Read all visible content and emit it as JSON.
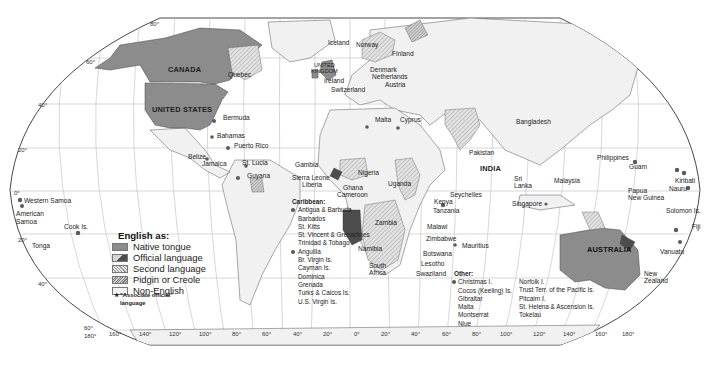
{
  "map": {
    "title": "English as:",
    "legend": [
      {
        "key": "native",
        "label": "Native tongue",
        "color": "#8c8c8c"
      },
      {
        "key": "official",
        "label": "Official language",
        "color": "#4d4d4d"
      },
      {
        "key": "second",
        "label": "Second language",
        "color": "#c8c8c8"
      },
      {
        "key": "pidgin",
        "label": "Pidgin or Creole",
        "color": "#b0b0b0"
      },
      {
        "key": "none",
        "label": "Non-English",
        "color": "#f1f1f1"
      }
    ],
    "note": {
      "symbol": "★",
      "line1": "\"Associate official\"",
      "line2": "language"
    },
    "latitudes": [
      "80°",
      "60°",
      "40°",
      "20°",
      "0°",
      "20°",
      "40°",
      "60°"
    ],
    "longitudes": [
      "180°",
      "160°",
      "140°",
      "120°",
      "100°",
      "80°",
      "60°",
      "40°",
      "20°",
      "0°",
      "20°",
      "40°",
      "60°",
      "80°",
      "100°",
      "120°",
      "140°",
      "160°",
      "180°"
    ],
    "country_labels": {
      "canada": "CANADA",
      "quebec": "Quebec",
      "united_states": "UNITED STATES",
      "iceland": "Iceland",
      "norway": "Norway",
      "finland": "Finland",
      "uk_line1": "UNITED",
      "uk_line2": "KINGDOM",
      "ireland": "Ireland",
      "denmark": "Denmark",
      "netherlands": "Netherlands",
      "austria": "Austria",
      "switzerland": "Switzerland",
      "malta": "Malta",
      "cyprus": "Cyprus",
      "bangladesh": "Bangladesh",
      "pakistan": "Pakistan",
      "india": "INDIA",
      "sri_lanka_1": "Sri",
      "sri_lanka_2": "Lanka",
      "bermuda": "Bermuda",
      "bahamas": "Bahamas",
      "puerto_rico": "Puerto Rico",
      "belize": "Belize",
      "jamaica": "Jamaica",
      "st_lucia": "St. Lucia",
      "guyana": "Guyana",
      "gambia": "Gambia",
      "sierra_leone": "Sierra Leone",
      "liberia": "Liberia",
      "ghana": "Ghana",
      "nigeria": "Nigeria",
      "cameroon": "Cameroon",
      "uganda": "Uganda",
      "kenya": "Kenya",
      "tanzania": "Tanzania",
      "seychelles": "Seychelles",
      "zambia": "Zambia",
      "malawi": "Malawi",
      "zimbabwe": "Zimbabwe",
      "mauritius": "Mauritius",
      "namibia": "Namibia",
      "botswana": "Botswana",
      "south_africa_1": "South",
      "south_africa_2": "Africa",
      "lesotho": "Lesotho",
      "swaziland": "Swaziland",
      "philippines": "Philippines",
      "guam": "Guam",
      "malaysia": "Malaysia",
      "singapore": "Singapore",
      "papua_1": "Papua",
      "papua_2": "New Guinea",
      "kiribati": "Kiribati",
      "nauru": "Nauru",
      "solomon": "Solomon Is.",
      "fiji": "Fiji",
      "vanuatu": "Vanuatu",
      "australia": "AUSTRALIA",
      "new_zealand_1": "New",
      "new_zealand_2": "Zealand",
      "western_samoa": "Western Samoa",
      "american_samoa_1": "American",
      "american_samoa_2": "Samoa",
      "cook": "Cook Is.",
      "tonga": "Tonga"
    },
    "caribbean": {
      "heading": "Caribbean:",
      "group1": [
        "Antigua & Barbuda",
        "Barbados",
        "St. Kitts",
        "St. Vincent & Grenadines",
        "Trinidad & Tobago"
      ],
      "group2": [
        "Anguilla",
        "Br. Virgin Is.",
        "Cayman Is.",
        "Dominica",
        "Grenada",
        "Turks & Caicos Is.",
        "U.S. Virgin Is."
      ]
    },
    "other": {
      "heading": "Other:",
      "col1": [
        "Christmas I.",
        "Cocos (Keeling) Is.",
        "Gibraltar",
        "Malta",
        "Montserrat",
        "Niue"
      ],
      "col2": [
        "Norfolk I.",
        "Trust Terr. of the Pacific Is.",
        "Pitcairn I.",
        "St. Helena  & Ascension Is.",
        "Tokelau"
      ]
    }
  }
}
